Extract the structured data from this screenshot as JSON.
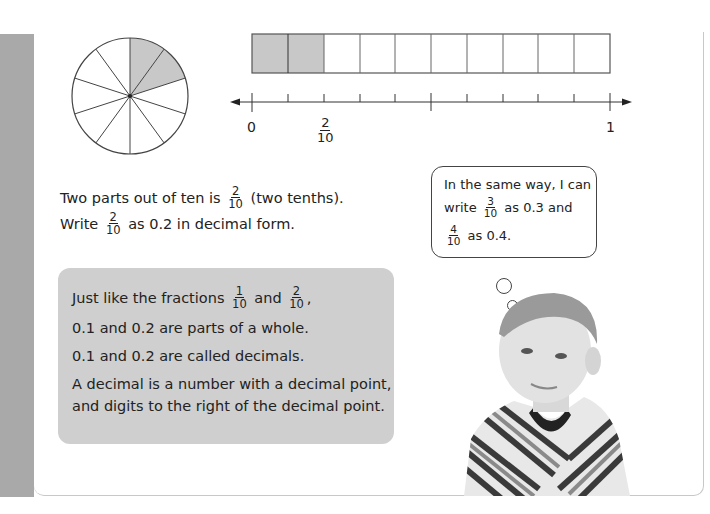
{
  "diagram": {
    "pie": {
      "slices": 10,
      "shaded": 2,
      "shade_color": "#c8c8c8"
    },
    "bar": {
      "cells": 10,
      "shaded": 2,
      "shade_color": "#c8c8c8"
    },
    "number_line": {
      "labels": {
        "start": "0",
        "end": "1",
        "marker_numerator": "2",
        "marker_denominator": "10"
      }
    }
  },
  "explanation": {
    "line1_before": "Two parts out of ten is",
    "line1_frac_num": "2",
    "line1_frac_den": "10",
    "line1_after": "(two tenths).",
    "line2_before": "Write",
    "line2_frac_num": "2",
    "line2_frac_den": "10",
    "line2_after": "as 0.2 in decimal form."
  },
  "thought_bubble": {
    "line1": "In the same way, I can",
    "line2_before": "write",
    "line2_frac_num": "3",
    "line2_frac_den": "10",
    "line2_after": "as 0.3 and",
    "line3_frac_num": "4",
    "line3_frac_den": "10",
    "line3_after": "as 0.4."
  },
  "info_box": {
    "line1_before": "Just like the fractions",
    "line1_frac1_num": "1",
    "line1_frac1_den": "10",
    "line1_mid": "and",
    "line1_frac2_num": "2",
    "line1_frac2_den": "10",
    "line1_after": ",",
    "line2": "0.1 and 0.2 are parts of a whole.",
    "line3": "0.1 and 0.2 are called decimals.",
    "line4": "A decimal is a number with a decimal point,",
    "line5": "and digits to the right of the decimal point."
  },
  "photo": {
    "subject": "boy in striped shirt thinking"
  }
}
